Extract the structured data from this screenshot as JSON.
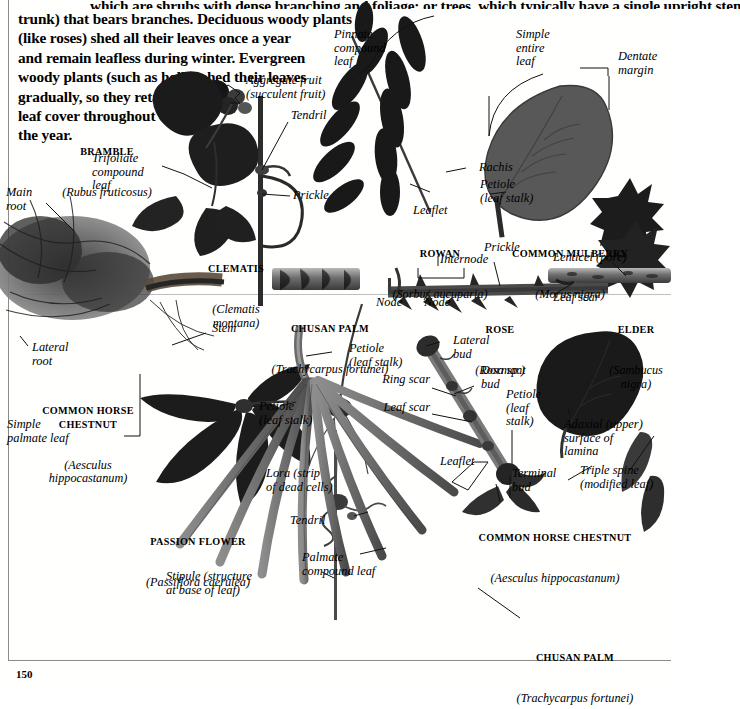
{
  "page": {
    "number": "150",
    "folio_label": "page-number"
  },
  "intro": {
    "cut_line": "which are shrubs with dense branching and foliage; or trees, which typically have a single upright stem (the",
    "lines": [
      "trunk) that bears branches. Deciduous woody plants",
      "(like roses) shed all their leaves once a year",
      "and remain leafless during winter. Evergreen",
      "woody plants (such as holly) shed their leaves",
      "gradually, so they retain full",
      "leaf cover throughout",
      "the year."
    ]
  },
  "specimens": [
    {
      "id": "bramble",
      "common": "BRAMBLE",
      "latin": "(Rubus fruticosus)"
    },
    {
      "id": "clematis",
      "common": "CLEMATIS",
      "latin": "(Clematis\nmontana)"
    },
    {
      "id": "rowan",
      "common": "ROWAN",
      "latin": "(Sorbus aucuparia)"
    },
    {
      "id": "mulberry",
      "common": "COMMON MULBERRY",
      "latin": "(Morus nigra)"
    },
    {
      "id": "chusan-palm-1",
      "common": "CHUSAN PALM",
      "latin": "(Trachycarpus fortunei)"
    },
    {
      "id": "rose",
      "common": "ROSE",
      "latin": "(Rosa sp.)"
    },
    {
      "id": "elder",
      "common": "ELDER",
      "latin": "(Sambucus\nnigra)"
    },
    {
      "id": "horse-chestnut-left",
      "common": "COMMON HORSE\nCHESTNUT",
      "latin": "(Aesculus\nhippocastanum)"
    },
    {
      "id": "passion-flower",
      "common": "PASSION FLOWER",
      "latin": "(Passiflora caerulea)"
    },
    {
      "id": "horse-chestnut-right",
      "common": "COMMON HORSE CHESTNUT",
      "latin": "(Aesculus hippocastanum)"
    },
    {
      "id": "chusan-palm-2",
      "common": "CHUSAN PALM",
      "latin": "(Trachycarpus fortunei)"
    }
  ],
  "annotations": {
    "aggregate_fruit": "Aggregate fruit\n(succulent fruit)",
    "tendril_top": "Tendril",
    "prickle_clematis": "Prickle",
    "trifoliate": "Trifoliate\ncompound\nleaf",
    "main_root": "Main\nroot",
    "pinnate": "Pinnate\ncompound\nleaf",
    "simple_entire": "Simple\nentire\nleaf",
    "dentate_margin": "Dentate\nmargin",
    "rachis": "Rachis",
    "petiole_mulberry": "Petiole\n(leaf stalk)",
    "leaflet_rowan": "Leaflet",
    "prickle_rose": "Prickle",
    "internode": "Internode",
    "node_left": "Node",
    "node_right": "Node",
    "lenticel": "Lenticel (pore)",
    "leaf_scar_elder": "Leaf scar",
    "stem": "Stem",
    "lateral_root": "Lateral\nroot",
    "petiole_hc_left": "Petiole\n(leaf stalk)",
    "simple_palmate": "Simple\npalmate leaf",
    "petiole_palm": "Petiole\n(leaf stalk)",
    "lateral_bud": "Lateral\nbud",
    "dormant_bud": "Dormant\nbud",
    "ring_scar": "Ring scar",
    "leaf_scar_hc": "Leaf scar",
    "petiole_hc_right": "Petiole\n(leaf\nstalk)",
    "leaflet_hc": "Leaflet",
    "terminal_bud": "Terminal\nbud",
    "adaxial": "Adaxial (upper)\nsurface of\nlamina",
    "triple_spine": "Triple spine\n(modified leaf)",
    "lora": "Lora (strip\nof dead cells)",
    "tendril_passion": "Tendril",
    "palmate_compound": "Palmate\ncompound leaf",
    "stipule": "Stipule (structure\nat base of leaf)"
  },
  "colors": {
    "ink": "#000000",
    "rule": "#8b8b8b",
    "specimen_dark": "#1d1d1d",
    "specimen_mid": "#5a5a5a",
    "specimen_light": "#9a9a9a",
    "paper": "#ffffff"
  }
}
